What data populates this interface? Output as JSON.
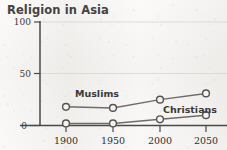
{
  "chart_data": {
    "type": "line",
    "title": "Religion in Asia",
    "xlabel": "",
    "ylabel": "",
    "x": [
      1900,
      1950,
      2000,
      2050
    ],
    "xtick_labels": [
      "1900",
      "1950",
      "2000",
      "2050"
    ],
    "ytick_labels": [
      "0",
      "50",
      "100"
    ],
    "yticks": [
      0,
      50,
      100
    ],
    "ylim": [
      0,
      100
    ],
    "xlim": [
      1900,
      2050
    ],
    "grid": true,
    "legend": "inline-labels",
    "series": [
      {
        "name": "Muslims",
        "label": "Muslims",
        "values": [
          18,
          17,
          25,
          31
        ],
        "color": "#6e6c6b",
        "marker": "open-circle"
      },
      {
        "name": "Christians",
        "label": "Christians",
        "values": [
          2,
          2,
          6,
          10
        ],
        "color": "#6e6c6b",
        "marker": "open-circle"
      }
    ],
    "annotations": [
      {
        "text": "Muslims",
        "x": 1950,
        "y": 30
      },
      {
        "text": "Christians",
        "x": 2020,
        "y": 17
      }
    ],
    "colors": {
      "background": "#edebe8",
      "axis": "#4a4848",
      "grid": "#d6d4d1",
      "line": "#6e6c6b",
      "title_text": "#444244",
      "tick_text": "#2f2d2f"
    }
  }
}
